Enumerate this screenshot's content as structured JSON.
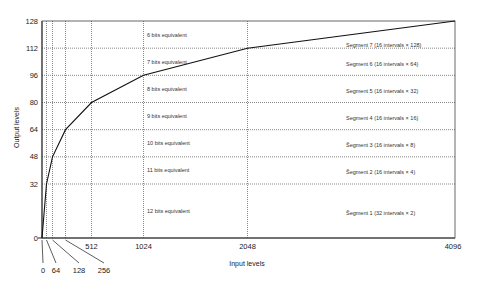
{
  "chart_data": {
    "type": "line",
    "title": "",
    "xlabel": "Input levels",
    "ylabel": "Output levels",
    "grid": true,
    "x_scale": "piecewise",
    "xlim": [
      0,
      4096
    ],
    "ylim": [
      0,
      128
    ],
    "x_ticks": [
      0,
      64,
      128,
      256,
      512,
      1024,
      2048,
      4096
    ],
    "x_tick_labels": [
      "0",
      "64",
      "128",
      "256",
      "512",
      "1024",
      "2048",
      "4096"
    ],
    "y_ticks": [
      0,
      32,
      48,
      64,
      80,
      96,
      112,
      128
    ],
    "y_tick_labels": [
      "0",
      "32",
      "48",
      "64",
      "80",
      "96",
      "112",
      "128"
    ],
    "series": [
      {
        "name": "compander curve",
        "x": [
          0,
          64,
          128,
          256,
          512,
          1024,
          2048,
          4096
        ],
        "y": [
          0,
          32,
          48,
          64,
          80,
          96,
          112,
          128
        ]
      }
    ],
    "bit_annotations": [
      {
        "label": "6 bits equivalent",
        "y_range": [
          112,
          128
        ]
      },
      {
        "label": "7 bits equivalent",
        "y_range": [
          96,
          112
        ]
      },
      {
        "label": "8 bits equivalent",
        "y_range": [
          80,
          96
        ]
      },
      {
        "label": "9 bits equivalent",
        "y_range": [
          64,
          80
        ]
      },
      {
        "label": "10 bits equivalent",
        "y_range": [
          48,
          64
        ]
      },
      {
        "label": "11 bits equivalent",
        "y_range": [
          32,
          48
        ]
      },
      {
        "label": "12 bits equivalent",
        "y_range": [
          0,
          32
        ]
      }
    ],
    "segment_annotations": [
      {
        "label": "Segment 7 (16 intervals  × 128)",
        "y_range": [
          112,
          128
        ]
      },
      {
        "label": "Segment 6 (16 intervals × 64)",
        "y_range": [
          96,
          112
        ]
      },
      {
        "label": "Segment 5 (16 intervals × 32)",
        "y_range": [
          80,
          96
        ]
      },
      {
        "label": "Segment 4 (16 intervals × 16)",
        "y_range": [
          64,
          80
        ]
      },
      {
        "label": "S̃egment 3 (16 intervals × 8)",
        "y_range": [
          48,
          64
        ]
      },
      {
        "label": "S̃egment 2 (16 intervals × 4)",
        "y_range": [
          32,
          48
        ]
      },
      {
        "label": "S̃egment 1 (32 intervals × 2)",
        "y_range": [
          0,
          32
        ]
      }
    ]
  }
}
